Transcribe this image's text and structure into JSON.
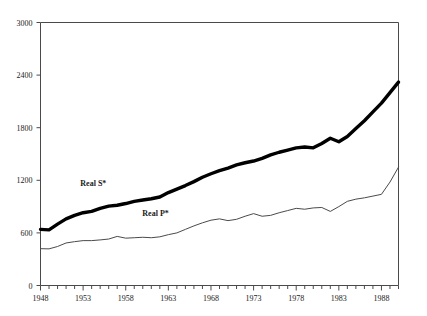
{
  "chart_data": {
    "type": "line",
    "title": "",
    "subtitle": "",
    "xlabel": "",
    "ylabel": "",
    "xlim": [
      1948,
      1990
    ],
    "ylim": [
      0,
      3000
    ],
    "grid": false,
    "legend_position": "inline-annotation",
    "y_ticks": [
      "0",
      "600",
      "1200",
      "1800",
      "2400",
      "3000"
    ],
    "y_tick_values": [
      0,
      600,
      1200,
      1800,
      2400,
      3000
    ],
    "x_ticks": [
      "1948",
      "1953",
      "1958",
      "1963",
      "1968",
      "1973",
      "1978",
      "1983",
      "1988"
    ],
    "x_tick_values": [
      1948,
      1953,
      1958,
      1963,
      1968,
      1973,
      1978,
      1983,
      1988
    ],
    "x_minor_tick_step": 1,
    "x": [
      1948,
      1949,
      1950,
      1951,
      1952,
      1953,
      1954,
      1955,
      1956,
      1957,
      1958,
      1959,
      1960,
      1961,
      1962,
      1963,
      1964,
      1965,
      1966,
      1967,
      1968,
      1969,
      1970,
      1971,
      1972,
      1973,
      1974,
      1975,
      1976,
      1977,
      1978,
      1979,
      1980,
      1981,
      1982,
      1983,
      1984,
      1985,
      1986,
      1987,
      1988,
      1989,
      1990
    ],
    "series": [
      {
        "name": "Real S*",
        "label": "Real  S*",
        "color": "#000000",
        "line_width": 3.4,
        "label_x": 1954.2,
        "label_y": 1135,
        "values": [
          640,
          635,
          700,
          760,
          800,
          830,
          845,
          880,
          905,
          915,
          935,
          960,
          975,
          990,
          1010,
          1060,
          1100,
          1140,
          1185,
          1235,
          1275,
          1310,
          1340,
          1375,
          1400,
          1420,
          1450,
          1490,
          1520,
          1545,
          1570,
          1580,
          1570,
          1620,
          1680,
          1640,
          1700,
          1790,
          1880,
          1980,
          2080,
          2200,
          2320
        ]
      },
      {
        "name": "Real P*",
        "label": "Real P*",
        "color": "#4a4a4a",
        "line_width": 1.0,
        "label_x": 1961.5,
        "label_y": 795,
        "values": [
          420,
          418,
          445,
          485,
          500,
          512,
          512,
          520,
          530,
          560,
          540,
          545,
          550,
          545,
          555,
          580,
          600,
          640,
          680,
          715,
          745,
          760,
          740,
          755,
          790,
          820,
          790,
          800,
          830,
          855,
          880,
          870,
          885,
          890,
          845,
          900,
          960,
          985,
          1000,
          1020,
          1040,
          1180,
          1350
        ]
      }
    ]
  },
  "axes": {
    "frame_color": "#4a4a4a",
    "tick_color": "#4a4a4a"
  }
}
